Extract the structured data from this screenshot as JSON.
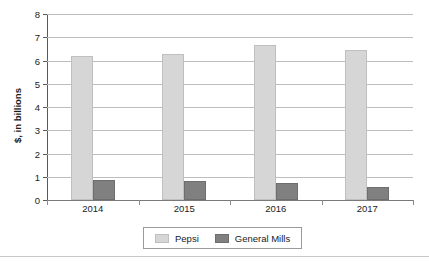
{
  "chart_data": {
    "type": "bar",
    "title": "",
    "xlabel": "",
    "ylabel": "$, in billions",
    "categories": [
      "2014",
      "2015",
      "2016",
      "2017"
    ],
    "series": [
      {
        "name": "Pepsi",
        "color": "#d6d6d6",
        "values": [
          6.2,
          6.3,
          6.65,
          6.45
        ]
      },
      {
        "name": "General Mills",
        "color": "#808080",
        "values": [
          0.87,
          0.83,
          0.75,
          0.57
        ]
      }
    ],
    "ylim": [
      0,
      8
    ],
    "ytick_labels": [
      "0",
      "1",
      "2",
      "3",
      "4",
      "5",
      "6",
      "7",
      "8"
    ],
    "ytick_values": [
      0,
      1,
      2,
      3,
      4,
      5,
      6,
      7,
      8
    ],
    "grid": true,
    "grid_axis": "y",
    "legend_position": "bottom",
    "legend_entries": [
      "Pepsi",
      "General Mills"
    ]
  }
}
